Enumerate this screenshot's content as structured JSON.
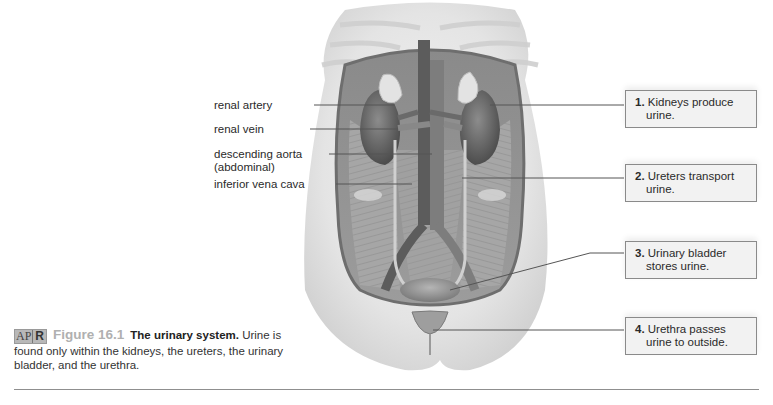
{
  "figure": {
    "badge_left": "AP",
    "badge_right": "R",
    "number": "Figure 16.1",
    "title": "The urinary system.",
    "caption": "Urine is found only within the kidneys, the ureters, the urinary bladder, and the urethra."
  },
  "left_labels": [
    {
      "text": "renal artery"
    },
    {
      "text": "renal vein"
    },
    {
      "text": "descending aorta",
      "text2": "(abdominal)"
    },
    {
      "text": "inferior vena cava"
    }
  ],
  "callouts": [
    {
      "num": "1.",
      "line1": "Kidneys produce",
      "line2": "urine."
    },
    {
      "num": "2.",
      "line1": "Ureters transport",
      "line2": "urine."
    },
    {
      "num": "3.",
      "line1": "Urinary bladder",
      "line2": "stores urine."
    },
    {
      "num": "4.",
      "line1": "Urethra passes",
      "line2": "urine to outside."
    }
  ],
  "colors": {
    "background": "#ffffff",
    "box_fill": "#f2f2f2",
    "box_border": "#8a8a8a",
    "leader_line": "#555555",
    "figure_number": "#b0b0b0"
  }
}
